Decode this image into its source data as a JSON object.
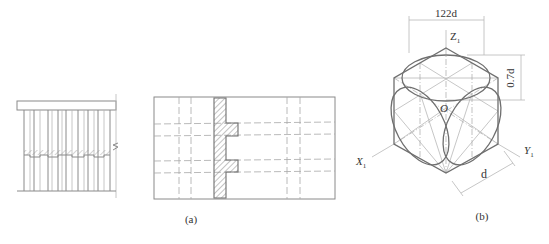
{
  "figure": {
    "panel_a": {
      "label": "(a)"
    },
    "panel_b": {
      "label": "(b)",
      "dim_top": "122d",
      "dim_right": "0.7d",
      "dim_bottom": "d",
      "axis_z": "Z",
      "axis_x": "X",
      "axis_y": "Y",
      "axis_subscript": "1",
      "origin": "O"
    }
  }
}
